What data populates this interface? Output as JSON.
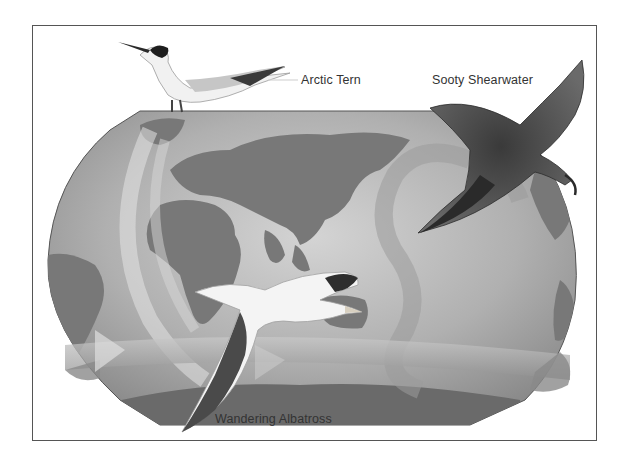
{
  "figure": {
    "type": "illustrated world map of seabird migration routes",
    "style": "grayscale",
    "labels": {
      "arctic_tern": "Arctic Tern",
      "sooty_shearwater": "Sooty Shearwater",
      "wandering_albatross": "Wandering Albatross"
    },
    "colors": {
      "frame_border": "#555555",
      "ocean": "#b8b8b8",
      "land": "#7a7a7a",
      "route_arrow": "#d0d0d0",
      "band": "#a9a9a9",
      "label_text": "#333333"
    },
    "birds": [
      {
        "name": "Arctic Tern",
        "position": "top-left, perched on map edge"
      },
      {
        "name": "Sooty Shearwater",
        "position": "top-right, in flight"
      },
      {
        "name": "Wandering Albatross",
        "position": "bottom-center, in flight"
      }
    ],
    "routes": [
      {
        "bird": "Arctic Tern",
        "shape": "long north-south arc along Atlantic"
      },
      {
        "bird": "Sooty Shearwater",
        "shape": "figure-eight loop in Pacific"
      },
      {
        "bird": "Wandering Albatross",
        "shape": "circumpolar band around Southern Ocean"
      }
    ]
  }
}
